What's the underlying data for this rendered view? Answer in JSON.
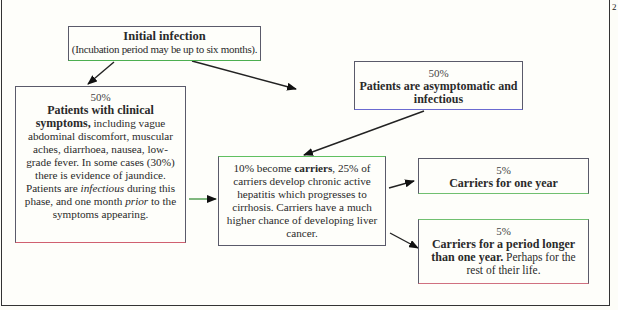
{
  "page_number": "2",
  "nodes": {
    "initial": {
      "title": "Initial infection",
      "subtitle": "(Incubation period may be up to six months)."
    },
    "clinical": {
      "percent": "50%",
      "bold_lead": "Patients with clinical symptoms,",
      "text_1": " including vague abdominal discomfort, muscular aches, diarrhoea, nausea, low-grade fever. In some cases (30%) there is evidence of jaundice. Patients are ",
      "italic_1": "infectious",
      "text_2": " during this phase, and one month ",
      "italic_2": "prior",
      "text_3": " to the symptoms appearing."
    },
    "asymptomatic": {
      "percent": "50%",
      "title": "Patients are asymptomatic and infectious"
    },
    "carriers": {
      "text_1": "10% become ",
      "bold": "carriers",
      "text_2": ", 25% of carriers develop chronic active hepatitis which progresses to cirrhosis. Carriers have a much higher chance of developing liver cancer."
    },
    "one_year": {
      "percent": "5%",
      "title": "Carriers for one year"
    },
    "longer": {
      "percent": "5%",
      "bold": "Carriers for a period longer than one year.",
      "text": " Perhaps for the rest of their life."
    }
  },
  "edges": [
    {
      "from": "initial",
      "to": "clinical"
    },
    {
      "from": "initial",
      "to": "asymptomatic"
    },
    {
      "from": "clinical",
      "to": "carriers"
    },
    {
      "from": "asymptomatic",
      "to": "carriers"
    },
    {
      "from": "carriers",
      "to": "one_year"
    },
    {
      "from": "carriers",
      "to": "longer"
    }
  ]
}
